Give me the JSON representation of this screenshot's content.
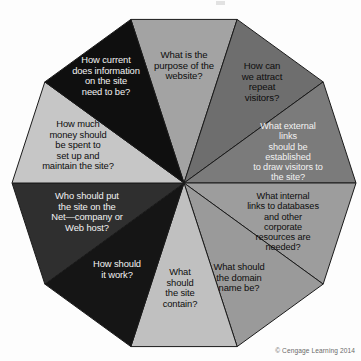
{
  "figure": {
    "title": "",
    "credit": "© Cengage Learning 2014",
    "shape": "decagon",
    "center": {
      "x": 184,
      "y": 183
    },
    "radius": 172,
    "background_color": "#fdfdfd",
    "outline_color": "#1a1a1a"
  },
  "wedges": [
    {
      "id": "purpose",
      "text": "What is the\npurpose of the\nwebsite?",
      "fill": "#a3a3a3",
      "text_color": "dark",
      "label_x": 184,
      "label_y": 66,
      "font_size": 9.6
    },
    {
      "id": "repeat-visitors",
      "text": "How can\nwe attract\nrepeat\nvisitors?",
      "fill": "#6e6e6e",
      "text_color": "dark",
      "label_x": 262,
      "label_y": 82,
      "font_size": 9.6
    },
    {
      "id": "external-links",
      "text": "What external links\nshould be established\nto draw visitors to\nthe site?",
      "fill": "#7b7b7b",
      "text_color": "light",
      "label_x": 288,
      "label_y": 152,
      "font_size": 9.2
    },
    {
      "id": "internal-links",
      "text": "What internal\nlinks to databases\nand other corporate\nresources are\nneeded?",
      "fill": "#9d9d9d",
      "text_color": "dark",
      "label_x": 283,
      "label_y": 222,
      "font_size": 9.2
    },
    {
      "id": "domain-name",
      "text": "What should\nthe domain\nname be?",
      "fill": "#9a9a9a",
      "text_color": "dark",
      "label_x": 239,
      "label_y": 278,
      "font_size": 9.4
    },
    {
      "id": "site-contain",
      "text": "What\nshould\nthe site\ncontain?",
      "fill": "#c0c0c0",
      "text_color": "dark",
      "label_x": 180,
      "label_y": 288,
      "font_size": 9.4
    },
    {
      "id": "how-work",
      "text": "How should\nit work?",
      "fill": "#151515",
      "text_color": "light",
      "label_x": 117,
      "label_y": 270,
      "font_size": 9.4
    },
    {
      "id": "who-hosts",
      "text": "Who should put\nthe site on the\nNet—company or\nWeb host?",
      "fill": "#2f2f2f",
      "text_color": "light",
      "label_x": 87,
      "label_y": 212,
      "font_size": 9.4
    },
    {
      "id": "money",
      "text": "How much\nmoney should\nbe spent to\nset up and\nmaintain the site?",
      "fill": "#c6c6c6",
      "text_color": "dark",
      "label_x": 78,
      "label_y": 145,
      "font_size": 9.4
    },
    {
      "id": "how-current",
      "text": "How current\ndoes information\non the site\nneed to be?",
      "fill": "#0f0f0f",
      "text_color": "light",
      "label_x": 106,
      "label_y": 76,
      "font_size": 9.4
    }
  ]
}
